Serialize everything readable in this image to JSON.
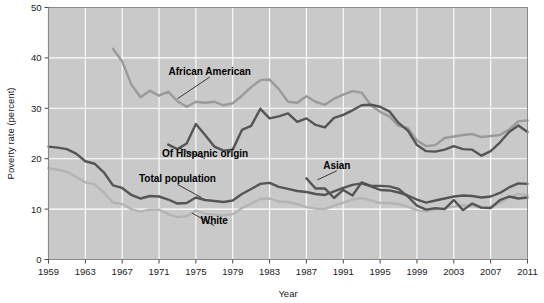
{
  "chart_data": {
    "type": "line",
    "title": "",
    "xlabel": "Year",
    "ylabel": "Poverty rate (percent)",
    "xlim": [
      1959,
      2011
    ],
    "ylim": [
      0,
      50
    ],
    "yticks": [
      0,
      10,
      20,
      30,
      40,
      50
    ],
    "ytick_labels": [
      "0",
      "10",
      "20",
      "30",
      "40",
      "50"
    ],
    "xticks": [
      1959,
      1963,
      1967,
      1971,
      1975,
      1979,
      1983,
      1987,
      1991,
      1995,
      1999,
      2003,
      2007,
      2011
    ],
    "xtick_labels": [
      "1959",
      "1963",
      "1967",
      "1971",
      "1975",
      "1979",
      "1983",
      "1987",
      "1991",
      "1995",
      "1999",
      "2003",
      "2007",
      "2011"
    ],
    "grid": true,
    "legend_position": "inline-annotations",
    "plot_background": "#c9c9c9",
    "gridline_color": "#ffffff",
    "series": [
      {
        "name": "African American",
        "color": "#9a9a9a",
        "label_anchor": {
          "x": 1976.5,
          "y": 36.6
        },
        "leader_to": {
          "x": 1973.0,
          "y": 31.9
        },
        "x": [
          1966,
          1967,
          1968,
          1969,
          1970,
          1971,
          1972,
          1973,
          1974,
          1975,
          1976,
          1977,
          1978,
          1979,
          1980,
          1981,
          1982,
          1983,
          1984,
          1985,
          1986,
          1987,
          1988,
          1989,
          1990,
          1991,
          1992,
          1993,
          1994,
          1995,
          1996,
          1997,
          1998,
          1999,
          2000,
          2001,
          2002,
          2003,
          2004,
          2005,
          2006,
          2007,
          2008,
          2009,
          2010,
          2011
        ],
        "y": [
          41.8,
          39.3,
          34.7,
          32.2,
          33.5,
          32.5,
          33.3,
          31.4,
          30.3,
          31.3,
          31.1,
          31.3,
          30.6,
          31.0,
          32.5,
          34.2,
          35.6,
          35.7,
          33.8,
          31.3,
          31.1,
          32.4,
          31.3,
          30.7,
          31.9,
          32.7,
          33.4,
          33.1,
          30.6,
          29.3,
          28.4,
          26.5,
          26.1,
          23.6,
          22.5,
          22.7,
          24.1,
          24.4,
          24.7,
          24.9,
          24.3,
          24.5,
          24.7,
          25.8,
          27.4,
          27.6
        ]
      },
      {
        "name": "Of Hispanic origin",
        "color": "#555555",
        "label_anchor": {
          "x": 1976.0,
          "y": 20.4
        },
        "leader_to": {
          "x": 1973.2,
          "y": 22.1
        },
        "x": [
          1972,
          1973,
          1974,
          1975,
          1976,
          1977,
          1978,
          1979,
          1980,
          1981,
          1982,
          1983,
          1984,
          1985,
          1986,
          1987,
          1988,
          1989,
          1990,
          1991,
          1992,
          1993,
          1994,
          1995,
          1996,
          1997,
          1998,
          1999,
          2000,
          2001,
          2002,
          2003,
          2004,
          2005,
          2006,
          2007,
          2008,
          2009,
          2010,
          2011
        ],
        "y": [
          22.8,
          21.9,
          23.0,
          26.9,
          24.7,
          22.4,
          21.6,
          21.8,
          25.7,
          26.5,
          29.9,
          28.0,
          28.4,
          29.0,
          27.3,
          28.0,
          26.7,
          26.2,
          28.1,
          28.7,
          29.6,
          30.6,
          30.7,
          30.3,
          29.4,
          27.1,
          25.6,
          22.7,
          21.5,
          21.4,
          21.8,
          22.5,
          21.9,
          21.8,
          20.6,
          21.5,
          23.2,
          25.3,
          26.6,
          25.3
        ]
      },
      {
        "name": "Total population",
        "color": "#555555",
        "label_anchor": {
          "x": 1973.0,
          "y": 15.3
        },
        "leader_to": {
          "x": 1975.6,
          "y": 12.3
        },
        "x": [
          1959,
          1960,
          1961,
          1962,
          1963,
          1964,
          1965,
          1966,
          1967,
          1968,
          1969,
          1970,
          1971,
          1972,
          1973,
          1974,
          1975,
          1976,
          1977,
          1978,
          1979,
          1980,
          1981,
          1982,
          1983,
          1984,
          1985,
          1986,
          1987,
          1988,
          1989,
          1990,
          1991,
          1992,
          1993,
          1994,
          1995,
          1996,
          1997,
          1998,
          1999,
          2000,
          2001,
          2002,
          2003,
          2004,
          2005,
          2006,
          2007,
          2008,
          2009,
          2010,
          2011
        ],
        "y": [
          22.4,
          22.2,
          21.9,
          21.0,
          19.5,
          19.0,
          17.3,
          14.7,
          14.2,
          12.8,
          12.1,
          12.6,
          12.5,
          11.9,
          11.1,
          11.2,
          12.3,
          11.8,
          11.6,
          11.4,
          11.7,
          13.0,
          14.0,
          15.0,
          15.2,
          14.4,
          14.0,
          13.6,
          13.4,
          13.0,
          12.8,
          13.5,
          14.2,
          14.8,
          15.1,
          14.5,
          13.8,
          13.7,
          13.3,
          12.7,
          11.9,
          11.3,
          11.7,
          12.1,
          12.5,
          12.7,
          12.6,
          12.3,
          12.5,
          13.2,
          14.3,
          15.1,
          15.0
        ]
      },
      {
        "name": "White",
        "color": "#b4b4b4",
        "label_anchor": {
          "x": 1977.0,
          "y": 7.1
        },
        "leader_to": {
          "x": 1974.6,
          "y": 9.2
        },
        "x": [
          1959,
          1960,
          1961,
          1962,
          1963,
          1964,
          1965,
          1966,
          1967,
          1968,
          1969,
          1970,
          1971,
          1972,
          1973,
          1974,
          1975,
          1976,
          1977,
          1978,
          1979,
          1980,
          1981,
          1982,
          1983,
          1984,
          1985,
          1986,
          1987,
          1988,
          1989,
          1990,
          1991,
          1992,
          1993,
          1994,
          1995,
          1996,
          1997,
          1998,
          1999,
          2000,
          2001,
          2002,
          2003,
          2004,
          2005,
          2006,
          2007,
          2008,
          2009,
          2010,
          2011
        ],
        "y": [
          18.1,
          17.8,
          17.4,
          16.4,
          15.3,
          14.9,
          13.3,
          11.3,
          11.0,
          10.0,
          9.5,
          9.9,
          9.9,
          9.0,
          8.4,
          8.6,
          9.7,
          9.1,
          8.9,
          8.7,
          9.0,
          10.2,
          11.1,
          12.0,
          12.1,
          11.5,
          11.4,
          11.0,
          10.4,
          10.1,
          10.0,
          10.7,
          11.3,
          11.9,
          12.2,
          11.7,
          11.2,
          11.2,
          11.0,
          10.5,
          9.8,
          9.5,
          9.9,
          10.2,
          10.5,
          10.8,
          10.6,
          10.3,
          10.5,
          11.2,
          12.3,
          13.0,
          12.8
        ]
      },
      {
        "name": "Asian",
        "color": "#555555",
        "label_anchor": {
          "x": 1990.3,
          "y": 18.0
        },
        "leader_to": {
          "x": 1988.2,
          "y": 15.8
        },
        "x": [
          1987,
          1988,
          1989,
          1990,
          1991,
          1992,
          1993,
          1994,
          1995,
          1996,
          1997,
          1998,
          1999,
          2000,
          2001,
          2002,
          2003,
          2004,
          2005,
          2006,
          2007,
          2008,
          2009,
          2010,
          2011
        ],
        "y": [
          16.1,
          14.1,
          14.1,
          12.2,
          13.8,
          12.7,
          15.3,
          14.6,
          14.6,
          14.5,
          14.0,
          12.5,
          10.7,
          9.9,
          10.2,
          10.0,
          11.8,
          9.8,
          11.1,
          10.3,
          10.2,
          11.8,
          12.5,
          12.1,
          12.3
        ]
      }
    ]
  }
}
